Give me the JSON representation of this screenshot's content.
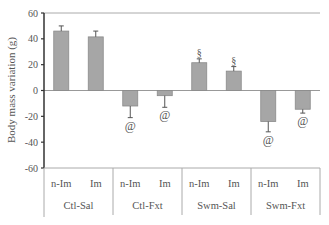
{
  "chart_data": {
    "type": "bar",
    "title": "",
    "xlabel": "",
    "ylabel": "Body mass variation (g)",
    "ylim": [
      -60,
      60
    ],
    "yticks": [
      60,
      40,
      20,
      0,
      -20,
      -40,
      -60
    ],
    "grid": false,
    "legend": null,
    "groups": [
      "Ctl-Sal",
      "Ctl-Fxt",
      "Swm-Sal",
      "Swm-Fxt"
    ],
    "subcategories": [
      "n-Im",
      "Im"
    ],
    "categories": [
      "Ctl-Sal n-Im",
      "Ctl-Sal Im",
      "Ctl-Fxt n-Im",
      "Ctl-Fxt Im",
      "Swm-Sal n-Im",
      "Swm-Sal Im",
      "Swm-Fxt n-Im",
      "Swm-Fxt Im"
    ],
    "values": [
      46,
      41.5,
      -12,
      -4,
      21.5,
      15,
      -24,
      -14.5
    ],
    "errors": [
      4,
      4.5,
      9,
      9,
      3,
      3.5,
      8,
      3
    ],
    "annotations": [
      "",
      "",
      "@",
      "@",
      "§",
      "§",
      "@",
      "@"
    ],
    "bar_color": "#a6a6a6",
    "bar_edge_color": "#8a8a8a"
  }
}
